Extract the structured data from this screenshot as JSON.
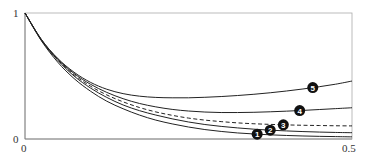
{
  "chart_data": {
    "type": "line",
    "title": "",
    "xlabel": "",
    "ylabel": "",
    "xlim": [
      0,
      0.5
    ],
    "ylim": [
      0,
      1
    ],
    "grid": false,
    "legend": "inline numbered markers",
    "x_ticks": [
      "0",
      "0.5"
    ],
    "y_ticks": [
      "0",
      "1"
    ],
    "x": [
      0,
      0.025,
      0.05,
      0.075,
      0.1,
      0.125,
      0.15,
      0.175,
      0.2,
      0.225,
      0.25,
      0.275,
      0.3,
      0.325,
      0.35,
      0.375,
      0.4,
      0.425,
      0.45,
      0.475,
      0.5
    ],
    "series": [
      {
        "name": "1",
        "style": "solid",
        "label_x": 0.355,
        "values": [
          1,
          0.78,
          0.61,
          0.48,
          0.38,
          0.3,
          0.24,
          0.19,
          0.15,
          0.12,
          0.095,
          0.075,
          0.06,
          0.048,
          0.04,
          0.033,
          0.028,
          0.024,
          0.021,
          0.019,
          0.017
        ]
      },
      {
        "name": "2",
        "style": "solid",
        "label_x": 0.375,
        "values": [
          1,
          0.785,
          0.625,
          0.5,
          0.405,
          0.33,
          0.27,
          0.225,
          0.19,
          0.16,
          0.135,
          0.115,
          0.1,
          0.088,
          0.078,
          0.07,
          0.064,
          0.059,
          0.055,
          0.052,
          0.05
        ]
      },
      {
        "name": "3",
        "style": "dashed",
        "label_x": 0.395,
        "values": [
          1,
          0.785,
          0.63,
          0.51,
          0.42,
          0.35,
          0.295,
          0.25,
          0.215,
          0.188,
          0.166,
          0.15,
          0.138,
          0.128,
          0.121,
          0.116,
          0.112,
          0.109,
          0.107,
          0.105,
          0.104
        ]
      },
      {
        "name": "4",
        "style": "solid",
        "label_x": 0.42,
        "values": [
          1,
          0.79,
          0.635,
          0.52,
          0.435,
          0.37,
          0.32,
          0.282,
          0.255,
          0.235,
          0.222,
          0.214,
          0.21,
          0.21,
          0.212,
          0.216,
          0.221,
          0.227,
          0.234,
          0.241,
          0.248
        ]
      },
      {
        "name": "5",
        "style": "solid",
        "label_x": 0.44,
        "values": [
          1,
          0.79,
          0.64,
          0.53,
          0.45,
          0.395,
          0.36,
          0.34,
          0.33,
          0.327,
          0.327,
          0.331,
          0.337,
          0.345,
          0.355,
          0.367,
          0.381,
          0.397,
          0.415,
          0.435,
          0.46
        ]
      }
    ]
  },
  "axes": {
    "x_min_label": "0",
    "x_max_label": "0.5",
    "y_min_label": "0",
    "y_max_label": "1"
  }
}
